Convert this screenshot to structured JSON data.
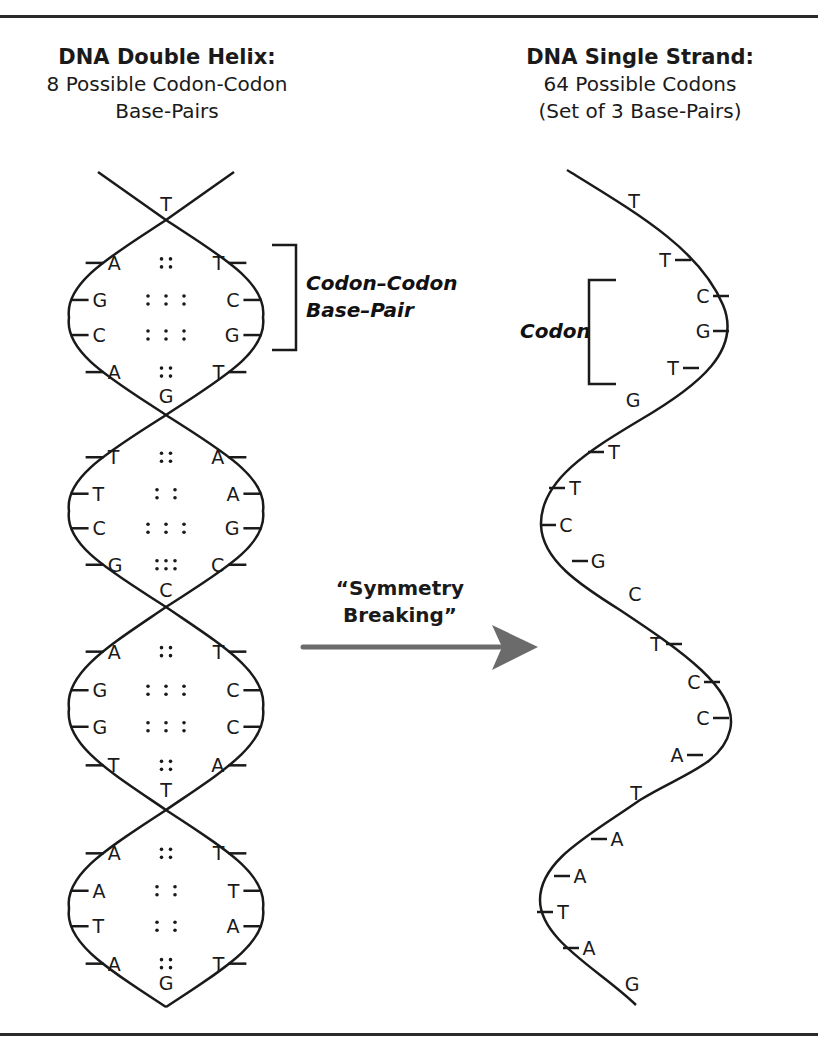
{
  "left_heading": {
    "title": "DNA Double Helix:",
    "line2": "8 Possible Codon-Codon",
    "line3": "Base-Pairs"
  },
  "right_heading": {
    "title": "DNA Single Strand:",
    "line2": "64 Possible Codons",
    "line3": "(Set of 3 Base-Pairs)"
  },
  "annotations": {
    "codon_codon_line1": "Codon–Codon",
    "codon_codon_line2": "Base–Pair",
    "codon": "Codon",
    "arrow_line1": "“Symmetry",
    "arrow_line2": "Breaking”"
  },
  "colors": {
    "line": "#1a1a1a",
    "arrow": "#6b6b6b",
    "background": "#ffffff"
  },
  "double_helix": {
    "crossing_labels": [
      "T",
      "G",
      "C",
      "T",
      "G"
    ],
    "segments": [
      {
        "pairs": [
          {
            "left": "A",
            "bond": "::",
            "right": "T"
          },
          {
            "left": "G",
            "bond": ":::",
            "right": "C"
          },
          {
            "left": "C",
            "bond": ":::",
            "right": "G"
          },
          {
            "left": "A",
            "bond": "::",
            "right": "T"
          }
        ]
      },
      {
        "pairs": [
          {
            "left": "T",
            "bond": "::",
            "right": "A"
          },
          {
            "left": "T",
            "bond": "::",
            "right": "A"
          },
          {
            "left": "C",
            "bond": ":::",
            "right": "G"
          },
          {
            "left": "G",
            "bond": ":::",
            "right": "C"
          }
        ]
      },
      {
        "pairs": [
          {
            "left": "A",
            "bond": "::",
            "right": "T"
          },
          {
            "left": "G",
            "bond": ":::",
            "right": "C"
          },
          {
            "left": "G",
            "bond": ":::",
            "right": "C"
          },
          {
            "left": "T",
            "bond": "::",
            "right": "A"
          }
        ]
      },
      {
        "pairs": [
          {
            "left": "A",
            "bond": "::",
            "right": "T"
          },
          {
            "left": "A",
            "bond": "::",
            "right": "T"
          },
          {
            "left": "T",
            "bond": "::",
            "right": "A"
          },
          {
            "left": "A",
            "bond": "::",
            "right": "T"
          }
        ]
      }
    ]
  },
  "single_strand": {
    "bases": [
      "T",
      "T",
      "C",
      "G",
      "T",
      "G",
      "T",
      "T",
      "C",
      "G",
      "C",
      "T",
      "C",
      "C",
      "A",
      "T",
      "A",
      "A",
      "T",
      "A",
      "G"
    ]
  }
}
